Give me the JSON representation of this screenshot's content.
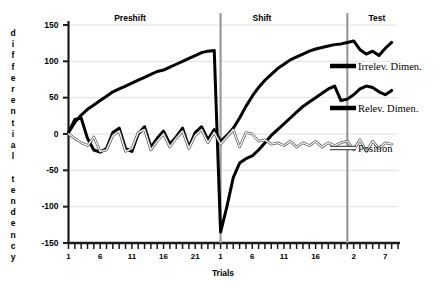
{
  "chart_data": {
    "type": "line",
    "title": "",
    "xlabel": "Trials",
    "ylabel": "differential tendency",
    "ylim": [
      -150,
      150
    ],
    "yticks": [
      150,
      100,
      50,
      0,
      -50,
      -100,
      -150
    ],
    "grid": true,
    "legend_position": "right",
    "phases": [
      {
        "name": "Preshift",
        "label": "Preshift",
        "trials": 24,
        "xticks": [
          1,
          6,
          11,
          16,
          21
        ]
      },
      {
        "name": "Shift",
        "label": "Shift",
        "trials": 20,
        "xticks": [
          1,
          6,
          11,
          16
        ]
      },
      {
        "name": "Test",
        "label": "Test",
        "trials": 8,
        "xticks": [
          2,
          7
        ]
      }
    ],
    "series": [
      {
        "name": "Irrelev. Dimen.",
        "color": "#000000",
        "style": "thick-black",
        "width": 3.0,
        "preshift": [
          2,
          20,
          22,
          -6,
          -22,
          -25,
          -20,
          2,
          8,
          -20,
          -24,
          0,
          10,
          -18,
          -6,
          4,
          -14,
          -4,
          8,
          -18,
          2,
          10,
          -8,
          6
        ],
        "shift": [
          -10,
          -2,
          8,
          22,
          38,
          52,
          64,
          74,
          82,
          90,
          96,
          102,
          106,
          110,
          114,
          117,
          119,
          121,
          123,
          124
        ],
        "test": [
          126,
          128,
          116,
          110,
          114,
          108,
          118,
          126
        ]
      },
      {
        "name": "Relev. Dimen.",
        "color": "#000000",
        "style": "thick-black",
        "width": 3.0,
        "preshift": [
          2,
          16,
          26,
          34,
          40,
          46,
          52,
          58,
          62,
          66,
          70,
          74,
          78,
          82,
          86,
          88,
          92,
          96,
          100,
          104,
          108,
          112,
          114,
          115
        ],
        "shift": [
          -135,
          -100,
          -60,
          -40,
          -34,
          -30,
          -22,
          -12,
          -2,
          6,
          14,
          22,
          30,
          38,
          44,
          50,
          56,
          62,
          66,
          46
        ],
        "test": [
          48,
          54,
          62,
          66,
          64,
          58,
          54,
          60
        ]
      },
      {
        "name": "Position",
        "color": "#808080",
        "style": "thin-outline",
        "width": 1.0,
        "preshift": [
          0,
          -6,
          -12,
          -16,
          -4,
          -24,
          -22,
          -2,
          4,
          -24,
          -20,
          2,
          6,
          -22,
          -10,
          0,
          -18,
          -6,
          4,
          -20,
          -2,
          6,
          -12,
          2
        ],
        "shift": [
          -14,
          -4,
          6,
          -18,
          2,
          0,
          -10,
          -8,
          -14,
          -12,
          -16,
          -10,
          -18,
          -12,
          -16,
          -10,
          -18,
          -12,
          -16,
          -12
        ],
        "test": [
          -10,
          -22,
          -8,
          -24,
          -10,
          -20,
          -12,
          -14
        ]
      }
    ]
  },
  "axes": {
    "y_labels": [
      "150",
      "100",
      "50",
      "0",
      "-50",
      "-100",
      "-150"
    ],
    "y_title_letters": "d\ni\nf\nf\ne\nr\ne\nn\nt\ni\na\nl\n \nt\ne\nn\nd\ne\nn\nc\ny",
    "x_title": "Trials",
    "x_tick_labels": [
      "1",
      "6",
      "11",
      "16",
      "21",
      "1",
      "6",
      "11",
      "16",
      "2",
      "7"
    ]
  },
  "sections": {
    "preshift": "Preshift",
    "shift": "Shift",
    "test": "Test"
  },
  "legend": {
    "items": [
      {
        "label": "Irrelev. Dimen.",
        "swatch": "thick-black"
      },
      {
        "label": "Relev. Dimen.",
        "swatch": "thick-black"
      },
      {
        "label": "Position",
        "swatch": "thin-outline"
      }
    ]
  }
}
